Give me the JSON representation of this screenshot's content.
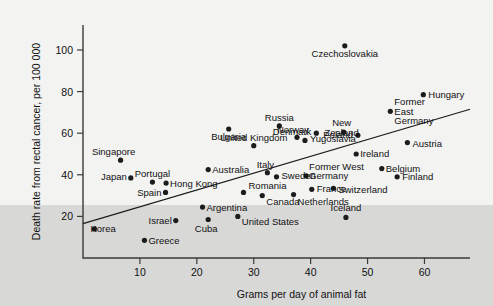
{
  "chart_data": {
    "type": "scatter",
    "title": "",
    "xlabel": "Grams per day of animal fat",
    "ylabel": "Death rate from rectal cancer, per 100 000",
    "xlim": [
      0,
      68
    ],
    "ylim": [
      0,
      112
    ],
    "xticks": [
      10,
      20,
      30,
      40,
      50,
      60
    ],
    "yticks": [
      20,
      40,
      60,
      80,
      100
    ],
    "grid": false,
    "legend": "none",
    "marker_color": "#1c1c1c",
    "trendline": {
      "x0": 0,
      "y0": 16.5,
      "x1": 68,
      "y1": 71.5,
      "label": ""
    },
    "points": [
      {
        "label": "Korea",
        "x": 2.0,
        "y": 14.0,
        "lx": -4,
        "ly": 3.5,
        "anchor": "start"
      },
      {
        "label": "Singapore",
        "x": 6.6,
        "y": 47.0,
        "lx": -7,
        "ly": -5,
        "anchor": "middle"
      },
      {
        "label": "Japan",
        "x": 8.4,
        "y": 38.5,
        "lx": -4,
        "ly": 2,
        "anchor": "end"
      },
      {
        "label": "Greece",
        "x": 10.8,
        "y": 8.5,
        "lx": 4,
        "ly": 3.5,
        "anchor": "start"
      },
      {
        "label": "Portugal",
        "x": 12.2,
        "y": 36.5,
        "lx": 0,
        "ly": -5,
        "anchor": "middle"
      },
      {
        "label": "Spain",
        "x": 14.5,
        "y": 31.5,
        "lx": -4,
        "ly": 3.5,
        "anchor": "end"
      },
      {
        "label": "Hong Kong",
        "x": 14.6,
        "y": 36.0,
        "lx": 4,
        "ly": 3.5,
        "anchor": "start"
      },
      {
        "label": "Israel",
        "x": 16.3,
        "y": 18.0,
        "lx": -4,
        "ly": 3.5,
        "anchor": "end"
      },
      {
        "label": "Cuba",
        "x": 22.0,
        "y": 18.5,
        "lx": -2,
        "ly": 12,
        "anchor": "middle"
      },
      {
        "label": "Argentina",
        "x": 21.0,
        "y": 24.5,
        "lx": 4,
        "ly": 3.5,
        "anchor": "start"
      },
      {
        "label": "Australia",
        "x": 22.0,
        "y": 42.5,
        "lx": 4,
        "ly": 3.5,
        "anchor": "start"
      },
      {
        "label": "Bulgaria",
        "x": 25.6,
        "y": 62.0,
        "lx": 0,
        "ly": 11,
        "anchor": "middle"
      },
      {
        "label": "United States",
        "x": 27.2,
        "y": 20.0,
        "lx": 4,
        "ly": 9,
        "anchor": "start"
      },
      {
        "label": "Romania",
        "x": 28.2,
        "y": 31.5,
        "lx": 5,
        "ly": -3,
        "anchor": "start"
      },
      {
        "label": "United Kingdom",
        "x": 30.0,
        "y": 54.0,
        "lx": 0,
        "ly": -5,
        "anchor": "middle"
      },
      {
        "label": "Italy",
        "x": 32.4,
        "y": 41.0,
        "lx": -2,
        "ly": -5,
        "anchor": "middle"
      },
      {
        "label": "Canada",
        "x": 31.5,
        "y": 30.0,
        "lx": 4,
        "ly": 9,
        "anchor": "start"
      },
      {
        "label": "Sweden",
        "x": 34.0,
        "y": 39.0,
        "lx": 5,
        "ly": 2,
        "anchor": "start"
      },
      {
        "label": "Russia",
        "x": 34.5,
        "y": 63.5,
        "lx": 0,
        "ly": -5,
        "anchor": "middle"
      },
      {
        "label": "Norway",
        "x": 37.6,
        "y": 58.0,
        "lx": -4,
        "ly": -4,
        "anchor": "middle"
      },
      {
        "label": "Netherlands",
        "x": 37.0,
        "y": 30.5,
        "lx": 4,
        "ly": 10,
        "anchor": "start"
      },
      {
        "label": "Yugoslavia",
        "x": 39.0,
        "y": 56.5,
        "lx": 5,
        "ly": 2,
        "anchor": "start"
      },
      {
        "label": "Former West Germany",
        "x": 39.2,
        "y": 39.5,
        "lx": 3,
        "ly": -6,
        "anchor": "start"
      },
      {
        "label": "France",
        "x": 40.2,
        "y": 33.0,
        "lx": 5,
        "ly": 3,
        "anchor": "start"
      },
      {
        "label": "Denmark",
        "x": 41.0,
        "y": 60.0,
        "lx": -5,
        "ly": 2,
        "anchor": "end"
      },
      {
        "label": "Switzerland",
        "x": 44.0,
        "y": 33.5,
        "lx": 5,
        "ly": 5,
        "anchor": "start"
      },
      {
        "label": "New Zealand",
        "x": 45.8,
        "y": 60.5,
        "lx": -2,
        "ly": -6,
        "anchor": "middle"
      },
      {
        "label": "Czechoslovakia",
        "x": 46.0,
        "y": 102.0,
        "lx": 0,
        "ly": 11,
        "anchor": "middle"
      },
      {
        "label": "Iceland",
        "x": 46.2,
        "y": 19.5,
        "lx": 0,
        "ly": -6,
        "anchor": "middle"
      },
      {
        "label": "Poland",
        "x": 48.3,
        "y": 59.0,
        "lx": -5,
        "ly": 3,
        "anchor": "end"
      },
      {
        "label": "Ireland",
        "x": 48.0,
        "y": 50.0,
        "lx": 4,
        "ly": 3,
        "anchor": "start"
      },
      {
        "label": "Belgium",
        "x": 52.5,
        "y": 43.0,
        "lx": 4,
        "ly": 3,
        "anchor": "start"
      },
      {
        "label": "Former East Germany",
        "x": 54.0,
        "y": 70.5,
        "lx": 4,
        "ly": -6,
        "anchor": "start"
      },
      {
        "label": "Finland",
        "x": 55.2,
        "y": 39.0,
        "lx": 5,
        "ly": 3,
        "anchor": "start"
      },
      {
        "label": "Austria",
        "x": 57.0,
        "y": 55.5,
        "lx": 5,
        "ly": 4,
        "anchor": "start"
      },
      {
        "label": "Hungary",
        "x": 59.8,
        "y": 78.5,
        "lx": 5,
        "ly": 3,
        "anchor": "start"
      }
    ]
  }
}
